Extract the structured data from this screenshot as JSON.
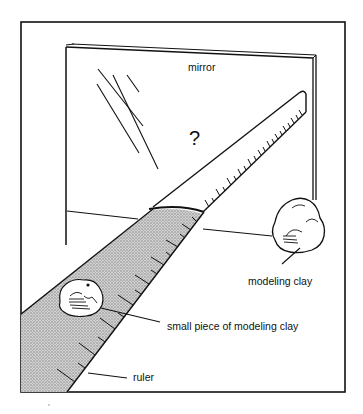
{
  "figure": {
    "labels": {
      "mirror": "mirror",
      "question": "?",
      "modeling_clay": "modeling clay",
      "small_clay": "small piece of modeling clay",
      "ruler": "ruler"
    },
    "colors": {
      "ink": "#111111",
      "background": "#ffffff",
      "ruler_shade": "#b8b8b8"
    }
  }
}
